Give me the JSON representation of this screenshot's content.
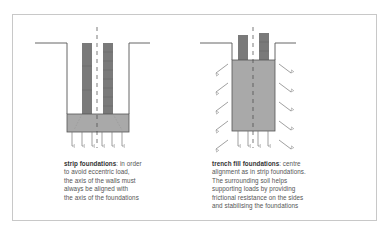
{
  "colors": {
    "frame": "#c8c8c8",
    "outline": "#555555",
    "wall": "#7a7a7a",
    "concrete": "#a9a9a9",
    "arrow": "#777777",
    "text": "#555555"
  },
  "left_diagram": {
    "caption": {
      "title": "strip foundations",
      "lines": [
        ": in order",
        "to avoid eccentric load,",
        "the axis of the walls must",
        "always be aligned with",
        "the axis of the foundations"
      ]
    },
    "bearing_arrow_count": 6
  },
  "right_diagram": {
    "caption": {
      "title": "trench fill foundations",
      "lines": [
        ": centre",
        "alignment as in strip foundations.",
        "The surrounding soil helps",
        "supporting loads by providing",
        "frictional resistance on the sides",
        "and stabilising the foundations"
      ]
    },
    "bearing_arrow_count": 4,
    "side_arrow_count_per_side": 5
  }
}
